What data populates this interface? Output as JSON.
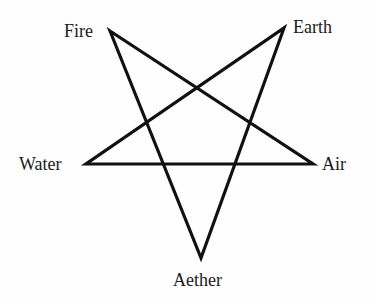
{
  "diagram": {
    "type": "pentagram",
    "stroke_color": "#111111",
    "background_color": "#fefefe",
    "vertices": [
      {
        "id": "fire",
        "label": "Fire",
        "x": 110,
        "y": 31
      },
      {
        "id": "earth",
        "label": "Earth",
        "x": 284,
        "y": 28
      },
      {
        "id": "water",
        "label": "Water",
        "x": 86,
        "y": 164
      },
      {
        "id": "air",
        "label": "Air",
        "x": 313,
        "y": 164
      },
      {
        "id": "aether",
        "label": "Aether",
        "x": 201,
        "y": 258
      }
    ],
    "edges": [
      [
        "fire",
        "air"
      ],
      [
        "air",
        "water"
      ],
      [
        "water",
        "earth"
      ],
      [
        "earth",
        "aether"
      ],
      [
        "aether",
        "fire"
      ]
    ]
  },
  "labels": {
    "fire": "Fire",
    "earth": "Earth",
    "water": "Water",
    "air": "Air",
    "aether": "Aether"
  }
}
